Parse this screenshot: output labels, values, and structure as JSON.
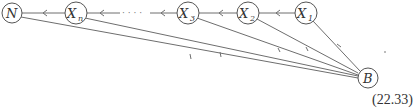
{
  "diagram": {
    "equation_number": "(22.33)",
    "line_color": "#6e6e6e",
    "nodes": [
      {
        "id": "N",
        "label": "N",
        "sub": "",
        "x": 12,
        "y": 13
      },
      {
        "id": "Xn",
        "label": "X",
        "sub": "n",
        "x": 76,
        "y": 13
      },
      {
        "id": "X3",
        "label": "X",
        "sub": "3",
        "x": 188,
        "y": 13
      },
      {
        "id": "X2",
        "label": "X",
        "sub": "2",
        "x": 248,
        "y": 13
      },
      {
        "id": "X1",
        "label": "X",
        "sub": "1",
        "x": 306,
        "y": 13
      },
      {
        "id": "B",
        "label": "B",
        "sub": "",
        "x": 368,
        "y": 78
      }
    ],
    "chain_edges": [
      {
        "from": "X1",
        "to": "X2"
      },
      {
        "from": "X2",
        "to": "X3"
      },
      {
        "from": "X3",
        "to": "dots"
      },
      {
        "from": "dots",
        "to": "Xn"
      },
      {
        "from": "Xn",
        "to": "N"
      }
    ],
    "ellipsis": "· · · ·",
    "fan_edges": [
      {
        "from": "B",
        "to": "X1"
      },
      {
        "from": "B",
        "to": "X2"
      },
      {
        "from": "B",
        "to": "X3"
      },
      {
        "from": "B",
        "to": "Xn"
      },
      {
        "from": "B",
        "to": "N"
      }
    ]
  }
}
